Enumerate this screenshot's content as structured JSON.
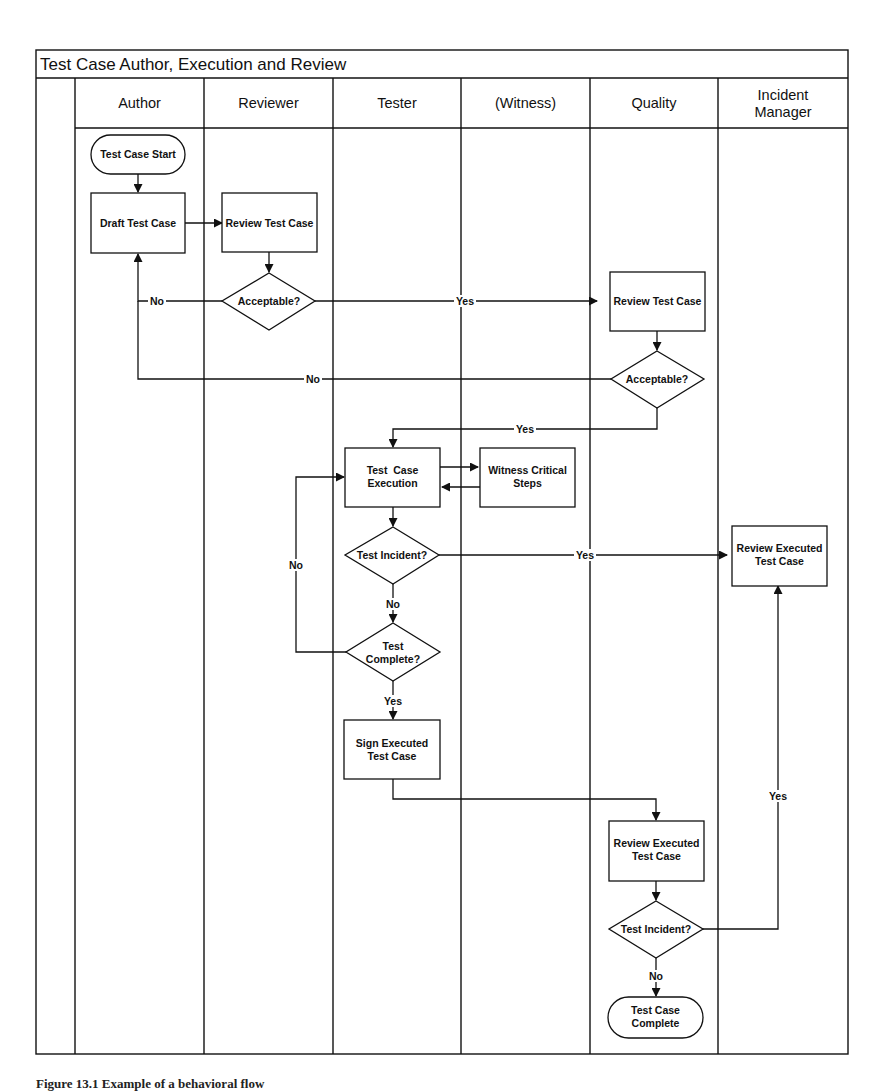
{
  "diagram": {
    "title": "Test Case Author, Execution and Review",
    "lanes": [
      {
        "id": "author",
        "label_lines": [
          "Author"
        ]
      },
      {
        "id": "reviewer",
        "label_lines": [
          "Reviewer"
        ]
      },
      {
        "id": "tester",
        "label_lines": [
          "Tester"
        ]
      },
      {
        "id": "witness",
        "label_lines": [
          "(Witness)"
        ]
      },
      {
        "id": "quality",
        "label_lines": [
          "Quality"
        ]
      },
      {
        "id": "incident-manager",
        "label_lines": [
          "Incident",
          "Manager"
        ]
      }
    ],
    "nodes": [
      {
        "id": "test-case-start",
        "type": "terminator",
        "lane": "author",
        "lines": [
          "Test Case Start"
        ]
      },
      {
        "id": "draft-test-case",
        "type": "process",
        "lane": "author",
        "lines": [
          "Draft Test Case"
        ]
      },
      {
        "id": "review-test-case-reviewer",
        "type": "process",
        "lane": "reviewer",
        "lines": [
          "Review Test Case"
        ]
      },
      {
        "id": "acceptable-reviewer",
        "type": "decision",
        "lane": "reviewer",
        "lines": [
          "Acceptable?"
        ]
      },
      {
        "id": "review-test-case-quality",
        "type": "process",
        "lane": "quality",
        "lines": [
          "Review Test Case"
        ]
      },
      {
        "id": "acceptable-quality",
        "type": "decision",
        "lane": "quality",
        "lines": [
          "Acceptable?"
        ]
      },
      {
        "id": "test-case-execution",
        "type": "process",
        "lane": "tester",
        "lines": [
          "Test  Case",
          "Execution"
        ]
      },
      {
        "id": "witness-critical-steps",
        "type": "process",
        "lane": "witness",
        "lines": [
          "Witness Critical",
          "Steps"
        ]
      },
      {
        "id": "test-incident-tester",
        "type": "decision",
        "lane": "tester",
        "lines": [
          "Test Incident?"
        ]
      },
      {
        "id": "test-complete",
        "type": "decision",
        "lane": "tester",
        "lines": [
          "Test",
          "Complete?"
        ]
      },
      {
        "id": "sign-executed-test-case",
        "type": "process",
        "lane": "tester",
        "lines": [
          "Sign Executed",
          "Test Case"
        ]
      },
      {
        "id": "review-executed-test-case-im",
        "type": "process",
        "lane": "incident-manager",
        "lines": [
          "Review Executed",
          "Test Case"
        ]
      },
      {
        "id": "review-executed-test-case-quality",
        "type": "process",
        "lane": "quality",
        "lines": [
          "Review Executed",
          "Test Case"
        ]
      },
      {
        "id": "test-incident-quality",
        "type": "decision",
        "lane": "quality",
        "lines": [
          "Test Incident?"
        ]
      },
      {
        "id": "test-case-complete",
        "type": "terminator",
        "lane": "quality",
        "lines": [
          "Test Case",
          "Complete"
        ]
      }
    ],
    "edges": [
      {
        "from": "test-case-start",
        "to": "draft-test-case",
        "label": ""
      },
      {
        "from": "draft-test-case",
        "to": "review-test-case-reviewer",
        "label": ""
      },
      {
        "from": "review-test-case-reviewer",
        "to": "acceptable-reviewer",
        "label": ""
      },
      {
        "from": "acceptable-reviewer",
        "to": "draft-test-case",
        "label": "No"
      },
      {
        "from": "acceptable-reviewer",
        "to": "review-test-case-quality",
        "label": "Yes"
      },
      {
        "from": "review-test-case-quality",
        "to": "acceptable-quality",
        "label": ""
      },
      {
        "from": "acceptable-quality",
        "to": "draft-test-case",
        "label": "No"
      },
      {
        "from": "acceptable-quality",
        "to": "test-case-execution",
        "label": "Yes"
      },
      {
        "from": "test-case-execution",
        "to": "witness-critical-steps",
        "label": ""
      },
      {
        "from": "witness-critical-steps",
        "to": "test-case-execution",
        "label": ""
      },
      {
        "from": "test-case-execution",
        "to": "test-incident-tester",
        "label": ""
      },
      {
        "from": "test-incident-tester",
        "to": "review-executed-test-case-im",
        "label": "Yes"
      },
      {
        "from": "test-incident-tester",
        "to": "test-complete",
        "label": "No"
      },
      {
        "from": "test-complete",
        "to": "test-case-execution",
        "label": "No"
      },
      {
        "from": "test-complete",
        "to": "sign-executed-test-case",
        "label": "Yes"
      },
      {
        "from": "sign-executed-test-case",
        "to": "review-executed-test-case-quality",
        "label": ""
      },
      {
        "from": "review-executed-test-case-quality",
        "to": "test-incident-quality",
        "label": ""
      },
      {
        "from": "test-incident-quality",
        "to": "review-executed-test-case-im",
        "label": "Yes"
      },
      {
        "from": "test-incident-quality",
        "to": "test-case-complete",
        "label": "No"
      }
    ],
    "edge_labels": {
      "yes": "Yes",
      "no": "No"
    }
  },
  "caption": "Figure 13.1 Example of a behavioral flow"
}
